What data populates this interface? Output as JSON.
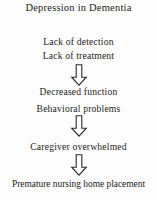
{
  "diagram": {
    "title": "Depression in Dementia",
    "background_color": "#fdfdfd",
    "text_color": "#1c1c1c",
    "arrow_outline_color": "#2a2a2a",
    "arrow_fill_color": "#ffffff",
    "arrow_icon_name": "hollow-down-arrow",
    "steps": [
      {
        "label": "Lack of detection",
        "top": 37
      },
      {
        "label": "Lack of treatment",
        "top": 51
      },
      {
        "label": "Decreased function",
        "top": 87
      },
      {
        "label": "Behavioral problems",
        "top": 104
      },
      {
        "label": "Caregiver overwhelmed",
        "top": 142
      },
      {
        "label": "Premature nursing home placement",
        "top": 180
      }
    ],
    "arrows": [
      {
        "top": 64
      },
      {
        "top": 115
      },
      {
        "top": 154
      }
    ]
  }
}
